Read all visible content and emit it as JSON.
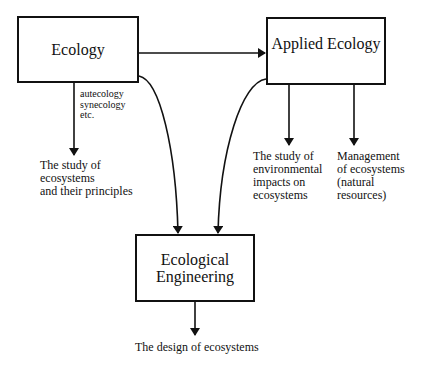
{
  "diagram": {
    "nodes": [
      {
        "id": "ecology",
        "label": "Ecology"
      },
      {
        "id": "applied_ecology",
        "label": "Applied Ecology"
      },
      {
        "id": "ecological_engineering",
        "label": "Ecological\nEngineering"
      }
    ],
    "annotations": {
      "ecology_subfields": "autecology\nsynecology\netc.",
      "ecology_output": "The study of\necosystems\nand their principles",
      "applied_output_1": "The study of\nenvironmental\nimpacts on\necosystems",
      "applied_output_2": "Management\nof ecosystems\n(natural\nresources)",
      "engineering_output": "The design of ecosystems"
    },
    "edges": [
      {
        "from": "ecology",
        "to": "applied_ecology",
        "type": "straight"
      },
      {
        "from": "ecology",
        "to": "ecology_output",
        "type": "straight"
      },
      {
        "from": "applied_ecology",
        "to": "applied_output_1",
        "type": "straight"
      },
      {
        "from": "applied_ecology",
        "to": "applied_output_2",
        "type": "straight"
      },
      {
        "from": "ecology",
        "to": "ecological_engineering",
        "type": "curved"
      },
      {
        "from": "applied_ecology",
        "to": "ecological_engineering",
        "type": "curved"
      },
      {
        "from": "ecological_engineering",
        "to": "engineering_output",
        "type": "straight"
      }
    ],
    "colors": {
      "stroke": "#111111",
      "background": "#ffffff"
    }
  }
}
